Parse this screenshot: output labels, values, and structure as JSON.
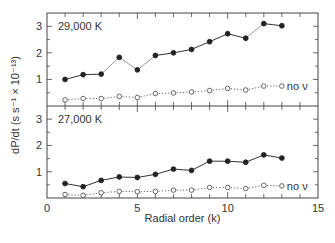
{
  "chart_data": {
    "type": "line",
    "layout": "two vertically stacked panels sharing x-axis",
    "xlabel": "Radial order (k)",
    "ylabel": "dP/dt (s s⁻¹ × 10⁻¹³)",
    "xlim": [
      0,
      15
    ],
    "xticks": [
      0,
      5,
      10,
      15
    ],
    "grid": false,
    "panels": [
      {
        "title": "29,000 K",
        "ylim": [
          0,
          3.5
        ],
        "yticks": [
          1,
          2,
          3
        ],
        "x": [
          1,
          2,
          3,
          4,
          5,
          6,
          7,
          8,
          9,
          10,
          11,
          12,
          13
        ],
        "series": [
          {
            "name": "with ν",
            "marker": "filled-circle",
            "line": "solid",
            "values": [
              1.0,
              1.18,
              1.2,
              1.83,
              1.36,
              1.9,
              2.0,
              2.13,
              2.42,
              2.72,
              2.55,
              3.1,
              3.02
            ]
          },
          {
            "name": "no ν",
            "marker": "open-circle",
            "line": "dotted",
            "values": [
              0.23,
              0.28,
              0.28,
              0.36,
              0.32,
              0.47,
              0.49,
              0.53,
              0.58,
              0.66,
              0.6,
              0.75,
              0.75
            ]
          }
        ],
        "annotation": "no ν"
      },
      {
        "title": "27,000 K",
        "ylim": [
          0,
          3.5
        ],
        "yticks": [
          1,
          2,
          3
        ],
        "x": [
          1,
          2,
          3,
          4,
          5,
          6,
          7,
          8,
          9,
          10,
          11,
          12,
          13
        ],
        "series": [
          {
            "name": "with ν",
            "marker": "filled-circle",
            "line": "solid",
            "values": [
              0.55,
              0.43,
              0.67,
              0.8,
              0.78,
              0.9,
              1.1,
              1.05,
              1.4,
              1.4,
              1.36,
              1.64,
              1.52
            ]
          },
          {
            "name": "no ν",
            "marker": "open-circle",
            "line": "dotted",
            "values": [
              0.13,
              0.1,
              0.2,
              0.25,
              0.24,
              0.25,
              0.3,
              0.3,
              0.4,
              0.4,
              0.36,
              0.48,
              0.46
            ]
          }
        ],
        "annotation": "no ν"
      }
    ]
  },
  "labels": {
    "xlabel": "Radial order (k)",
    "ylabel": "dP/dt (s s⁻¹ × 10⁻¹³)"
  },
  "colors": {
    "axis": "#444444",
    "filled_line": "#333333",
    "filled_line_light": "#9a9a9a",
    "open_line": "#555555",
    "text": "#333333"
  }
}
